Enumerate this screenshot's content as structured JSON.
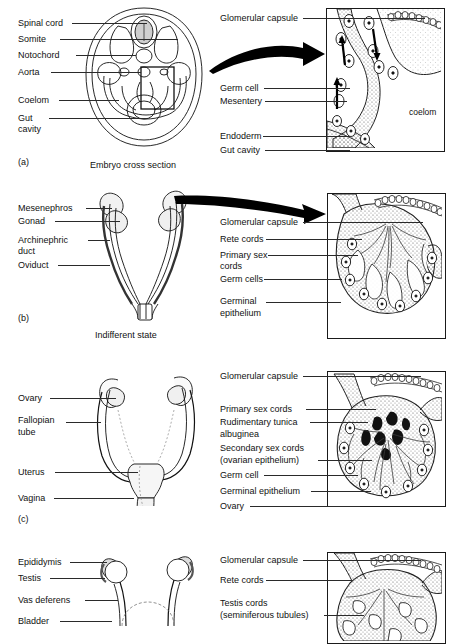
{
  "figure": {
    "title_visible": false,
    "background": "#ffffff",
    "ink": "#000000"
  },
  "panels": [
    {
      "id": "a",
      "panel_letter": "(a)",
      "caption": "Embryo cross section",
      "left_labels": [
        "Spinal cord",
        "Somite",
        "Notochord",
        "Aorta",
        "Coelom",
        "Gut",
        "cavity"
      ],
      "right_labels": [
        "Glomerular capsule",
        "Germ cell",
        "Mesentery",
        "Endoderm",
        "Gut cavity"
      ],
      "inset_text": [
        "coelom"
      ]
    },
    {
      "id": "b",
      "panel_letter": "(b)",
      "caption": "Indifferent state",
      "left_labels": [
        "Mesenephros",
        "Gonad",
        "Archinephric",
        "duct",
        "Oviduct"
      ],
      "right_labels": [
        "Glomerular capsule",
        "Rete cords",
        "Primary sex",
        "cords",
        "Germ cells",
        "Germinal",
        "epithelium"
      ],
      "inset_text": []
    },
    {
      "id": "c",
      "panel_letter": "(c)",
      "caption": "",
      "left_labels": [
        "Ovary",
        "Fallopian",
        "tube",
        "Uterus",
        "Vagina"
      ],
      "right_labels": [
        "Glomerular capsule",
        "Primary sex cords",
        "Rudimentary tunica",
        "albuginea",
        "Secondary sex cords",
        "(ovarian epithelium)",
        "Germ cell",
        "Germinal epithelium",
        "Ovary"
      ],
      "inset_text": []
    },
    {
      "id": "d",
      "panel_letter": "",
      "caption": "",
      "left_labels": [
        "Epididymis",
        "Testis",
        "Vas deferens",
        "Bladder"
      ],
      "right_labels": [
        "Glomerular capsule",
        "Rete cords",
        "Testis cords",
        "(seminiferous tubules)"
      ],
      "inset_text": []
    }
  ],
  "labels": {
    "a_spinal_cord": "Spinal cord",
    "a_somite": "Somite",
    "a_notochord": "Notochord",
    "a_aorta": "Aorta",
    "a_coelom": "Coelom",
    "a_gut": "Gut",
    "a_cavity": "cavity",
    "a_panel": "(a)",
    "a_caption": "Embryo cross section",
    "a_glomerular_capsule": "Glomerular capsule",
    "a_germ_cell": "Germ cell",
    "a_mesentery": "Mesentery",
    "a_endoderm": "Endoderm",
    "a_gut_cavity": "Gut cavity",
    "a_coelom_inset": "coelom",
    "b_mesenephros": "Mesenephros",
    "b_gonad": "Gonad",
    "b_archinephric": "Archinephric",
    "b_duct": "duct",
    "b_oviduct": "Oviduct",
    "b_panel": "(b)",
    "b_caption": "Indifferent state",
    "b_glomerular_capsule": "Glomerular capsule",
    "b_rete_cords": "Rete cords",
    "b_primary_sex": "Primary sex",
    "b_cords": "cords",
    "b_germ_cells": "Germ cells",
    "b_germinal": "Germinal",
    "b_epithelium": "epithelium",
    "c_ovary": "Ovary",
    "c_fallopian": "Fallopian",
    "c_tube": "tube",
    "c_uterus": "Uterus",
    "c_vagina": "Vagina",
    "c_panel": "(c)",
    "c_glomerular_capsule": "Glomerular capsule",
    "c_primary_sex_cords": "Primary sex cords",
    "c_rudimentary_tunica": "Rudimentary tunica",
    "c_albuginea": "albuginea",
    "c_secondary_sex_cords": "Secondary sex cords",
    "c_ovarian_epithelium": "(ovarian epithelium)",
    "c_germ_cell": "Germ cell",
    "c_germinal_epithelium": "Germinal epithelium",
    "c_ovary_right": "Ovary",
    "d_epididymis": "Epididymis",
    "d_testis": "Testis",
    "d_vas_deferens": "Vas deferens",
    "d_bladder": "Bladder",
    "d_glomerular_capsule": "Glomerular capsule",
    "d_rete_cords": "Rete cords",
    "d_testis_cords": "Testis cords",
    "d_seminiferous_tubules": "(seminiferous tubules)"
  }
}
